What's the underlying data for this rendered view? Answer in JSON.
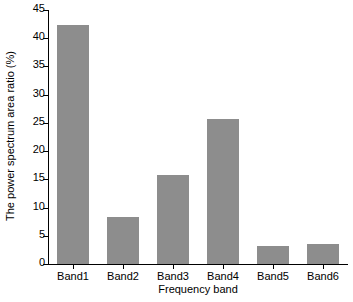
{
  "chart_data": {
    "type": "bar",
    "title": "",
    "xlabel": "Frequency band",
    "ylabel": "The power spectrum area ratio (%)",
    "categories": [
      "Band1",
      "Band2",
      "Band3",
      "Band4",
      "Band5",
      "Band6"
    ],
    "values": [
      42.4,
      8.3,
      15.7,
      25.7,
      3.2,
      3.6
    ],
    "ylim": [
      0,
      45
    ],
    "yticks": [
      0,
      5,
      10,
      15,
      20,
      25,
      30,
      35,
      40,
      45
    ],
    "ytick_labels": [
      "0",
      "5",
      "10",
      "15",
      "20",
      "25",
      "30",
      "35",
      "40",
      "45"
    ],
    "grid": false,
    "legend": null,
    "bar_color": "#8d8d8d",
    "axis_color": "#000000",
    "background": "#ffffff"
  }
}
